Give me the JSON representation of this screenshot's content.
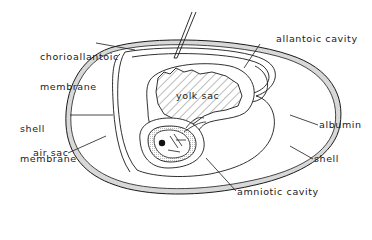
{
  "diagram": {
    "labels": {
      "chorioallantoic_line1": "chorioallantoic",
      "chorioallantoic_line2": "membrane",
      "allantoic_cavity": "allantoic cavity",
      "yolk_sac": "yolk sac",
      "shell_membrane_line1": "shell",
      "shell_membrane_line2": "membrane",
      "air_sac": "air sac",
      "albumin": "albumin",
      "shell": "shell",
      "amniotic_cavity": "amniotic cavity"
    },
    "colors": {
      "line": "#1a1a1a",
      "shell_fill": "#d8d8d8",
      "hatch": "#555555",
      "background": "#ffffff"
    }
  }
}
